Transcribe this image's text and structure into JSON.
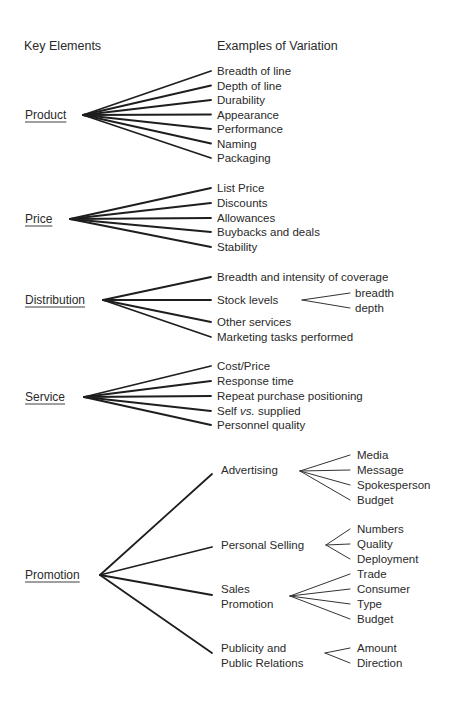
{
  "headers": {
    "key_elements": "Key Elements",
    "examples_of_variation": "Examples of Variation"
  },
  "groups": [
    {
      "key": "Product",
      "items": [
        "Breadth of line",
        "Depth of line",
        "Durability",
        "Appearance",
        "Performance",
        "Naming",
        "Packaging"
      ]
    },
    {
      "key": "Price",
      "items": [
        "List Price",
        "Discounts",
        "Allowances",
        "Buybacks and deals",
        "Stability"
      ]
    },
    {
      "key": "Distribution",
      "items": [
        "Breadth and intensity of coverage",
        "Stock levels",
        "Other services",
        "Marketing tasks performed"
      ],
      "sub": {
        "Stock levels": [
          "breadth",
          "depth"
        ]
      }
    },
    {
      "key": "Service",
      "items": [
        "Cost/Price",
        "Response time",
        "Repeat purchase positioning",
        "Self vs. supplied",
        "Personnel quality"
      ]
    },
    {
      "key": "Promotion",
      "items": [
        "Advertising",
        "Personal Selling",
        "Sales Promotion",
        "Publicity and Public Relations"
      ],
      "item_lines": [
        [
          "Advertising"
        ],
        [
          "Personal Selling"
        ],
        [
          "Sales",
          "Promotion"
        ],
        [
          "Publicity and",
          "Public Relations"
        ]
      ],
      "sub": {
        "Advertising": [
          "Media",
          "Message",
          "Spokesperson",
          "Budget"
        ],
        "Personal Selling": [
          "Numbers",
          "Quality",
          "Deployment"
        ],
        "Sales Promotion": [
          "Trade",
          "Consumer",
          "Type",
          "Budget"
        ],
        "Publicity and Public Relations": [
          "Amount",
          "Direction"
        ]
      }
    }
  ]
}
